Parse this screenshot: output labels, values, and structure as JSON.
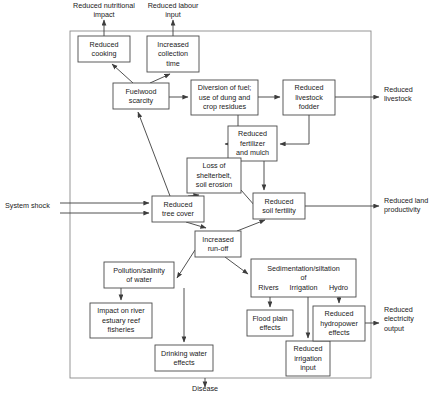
{
  "diagram": {
    "frame": {
      "x": 70,
      "y": 31,
      "width": 301,
      "height": 347
    },
    "colors": {
      "box_stroke": "#4a4a4a",
      "frame_stroke": "#8a8a8a",
      "edge_stroke": "#3d3d3d",
      "text": "#1a1a1a",
      "background": "#ffffff"
    },
    "nodes": [
      {
        "id": "reduced-cooking",
        "x": 78,
        "y": 36,
        "w": 52,
        "h": 26,
        "lines": [
          "Reduced",
          "cooking"
        ]
      },
      {
        "id": "increased-collection-time",
        "x": 147,
        "y": 36,
        "w": 52,
        "h": 36,
        "lines": [
          "Increased",
          "collection",
          "time"
        ]
      },
      {
        "id": "fuelwood-scarcity",
        "x": 113,
        "y": 83,
        "w": 56,
        "h": 26,
        "lines": [
          "Fuelwood",
          "scarcity"
        ]
      },
      {
        "id": "diversion-of-fuel",
        "x": 191,
        "y": 80,
        "w": 67,
        "h": 35,
        "lines": [
          "Diversion of fuel;",
          "use of dung and",
          "crop residues"
        ]
      },
      {
        "id": "reduced-livestock-fodder",
        "x": 283,
        "y": 80,
        "w": 52,
        "h": 35,
        "lines": [
          "Reduced",
          "livestock",
          "fodder"
        ]
      },
      {
        "id": "reduced-fertilizer-and-mulch",
        "x": 228,
        "y": 126,
        "w": 49,
        "h": 35,
        "lines": [
          "Reduced",
          "fertilizer",
          "and mulch"
        ]
      },
      {
        "id": "loss-of-shelterbelt",
        "x": 187,
        "y": 158,
        "w": 54,
        "h": 35,
        "lines": [
          "Loss of",
          "shelterbelt,",
          "soil erosion"
        ]
      },
      {
        "id": "reduced-tree-cover",
        "x": 152,
        "y": 196,
        "w": 52,
        "h": 26,
        "lines": [
          "Reduced",
          "tree cover"
        ]
      },
      {
        "id": "reduced-soil-fertility",
        "x": 253,
        "y": 193,
        "w": 52,
        "h": 26,
        "lines": [
          "Reduced",
          "soil fertility"
        ]
      },
      {
        "id": "increased-run-off",
        "x": 195,
        "y": 231,
        "w": 46,
        "h": 26,
        "lines": [
          "Increased",
          "run-off"
        ]
      },
      {
        "id": "pollution-salinity-of-water",
        "x": 104,
        "y": 262,
        "w": 70,
        "h": 26,
        "lines": [
          "Pollution/salinity",
          "of water"
        ]
      },
      {
        "id": "sedimentation-siltation",
        "x": 251,
        "y": 259,
        "w": 105,
        "h": 38,
        "lines": [
          "Sedimentation/siltation",
          "of"
        ],
        "sublabels": [
          "Rivers",
          "Irrigation",
          "Hydro"
        ]
      },
      {
        "id": "impact-on-river-estuary-reef-fisheries",
        "x": 90,
        "y": 303,
        "w": 62,
        "h": 35,
        "lines": [
          "Impact on river",
          "estuary reef",
          "fisheries"
        ]
      },
      {
        "id": "drinking-water-effects",
        "x": 155,
        "y": 345,
        "w": 58,
        "h": 26,
        "lines": [
          "Drinking water",
          "effects"
        ]
      },
      {
        "id": "flood-plain-effects",
        "x": 247,
        "y": 310,
        "w": 46,
        "h": 26,
        "lines": [
          "Flood plain",
          "effects"
        ]
      },
      {
        "id": "reduced-irrigation-input",
        "x": 286,
        "y": 341,
        "w": 44,
        "h": 35,
        "lines": [
          "Reduced",
          "irrigation",
          "input"
        ]
      },
      {
        "id": "reduced-hydropower-effects",
        "x": 313,
        "y": 306,
        "w": 52,
        "h": 35,
        "lines": [
          "Reduced",
          "hydropower",
          "effects"
        ]
      }
    ],
    "free_labels": [
      {
        "id": "reduced-nutritional-impact",
        "x": 104,
        "y": 8,
        "align": "middle",
        "lines": [
          "Reduced nutritional",
          "impact"
        ]
      },
      {
        "id": "reduced-labour-input",
        "x": 173,
        "y": 8,
        "align": "middle",
        "lines": [
          "Reduced labour",
          "input"
        ]
      },
      {
        "id": "system-shock",
        "x": 5,
        "y": 208,
        "align": "start",
        "lines": [
          "System shock"
        ]
      },
      {
        "id": "reduced-livestock",
        "x": 384,
        "y": 92,
        "align": "start",
        "lines": [
          "Reduced",
          "livestock"
        ]
      },
      {
        "id": "reduced-land-productivity",
        "x": 384,
        "y": 203,
        "align": "start",
        "lines": [
          "Reduced land",
          "productivity"
        ]
      },
      {
        "id": "reduced-electricity-output",
        "x": 384,
        "y": 312,
        "align": "start",
        "lines": [
          "Reduced",
          "electricity",
          "output"
        ]
      },
      {
        "id": "disease",
        "x": 205,
        "y": 391,
        "align": "middle",
        "lines": [
          "Disease"
        ]
      }
    ],
    "edges": [
      {
        "id": "reduced-cooking-to-nutritional",
        "from": "reduced-cooking",
        "to": "reduced-nutritional-impact",
        "points": "104,36 104,20",
        "arrow": true
      },
      {
        "id": "collection-time-to-labour-input",
        "from": "increased-collection-time",
        "to": "reduced-labour-input",
        "points": "173,36 173,20",
        "arrow": true
      },
      {
        "id": "fuelwood-to-cooking",
        "from": "fuelwood-scarcity",
        "to": "reduced-cooking",
        "points": "133,83 112,64",
        "arrow": true
      },
      {
        "id": "fuelwood-to-collection-time",
        "from": "fuelwood-scarcity",
        "to": "increased-collection-time",
        "points": "150,83 170,74",
        "arrow": true
      },
      {
        "id": "fuelwood-to-diversion",
        "from": "fuelwood-scarcity",
        "to": "diversion-of-fuel",
        "points": "169,97 188,97",
        "arrow": true
      },
      {
        "id": "diversion-to-livestock-fodder",
        "from": "diversion-of-fuel",
        "to": "reduced-livestock-fodder",
        "points": "258,97 280,97",
        "arrow": true
      },
      {
        "id": "diversion-to-fertilizer",
        "from": "diversion-of-fuel",
        "to": "reduced-fertilizer-and-mulch",
        "points": "238,115 238,144 225,144",
        "arrow": true
      },
      {
        "id": "livestock-fodder-to-fertilizer",
        "from": "reduced-livestock-fodder",
        "to": "reduced-fertilizer-and-mulch",
        "points": "309,115 309,144 280,144",
        "arrow": true
      },
      {
        "id": "livestock-fodder-to-reduced-livestock",
        "from": "reduced-livestock-fodder",
        "to": "reduced-livestock",
        "points": "335,97 379,97",
        "arrow": true
      },
      {
        "id": "fertilizer-to-soil-fertility",
        "from": "reduced-fertilizer-and-mulch",
        "to": "reduced-soil-fertility",
        "points": "264,161 264,190",
        "arrow": true
      },
      {
        "id": "tree-cover-to-fuelwood",
        "from": "reduced-tree-cover",
        "to": "fuelwood-scarcity",
        "points": "170,196 138,112",
        "arrow": true
      },
      {
        "id": "tree-cover-to-loss-shelterbelt",
        "from": "reduced-tree-cover",
        "to": "loss-of-shelterbelt",
        "points": "188,196 199,195",
        "arrow": true
      },
      {
        "id": "loss-shelterbelt-to-soil-fertility",
        "from": "loss-of-shelterbelt",
        "to": "reduced-soil-fertility",
        "points": "241,190 262,214",
        "arrow": true
      },
      {
        "id": "system-shock-to-tree-cover-1",
        "from": "system-shock",
        "to": "reduced-tree-cover",
        "points": "60,203 149,203",
        "arrow": true
      },
      {
        "id": "system-shock-to-tree-cover-2",
        "from": "system-shock",
        "to": "reduced-tree-cover",
        "points": "60,213 149,213",
        "arrow": true
      },
      {
        "id": "soil-fertility-to-land-productivity",
        "from": "reduced-soil-fertility",
        "to": "reduced-land-productivity",
        "points": "305,206 379,206",
        "arrow": true
      },
      {
        "id": "tree-cover-to-run-off",
        "from": "reduced-tree-cover",
        "to": "increased-run-off",
        "points": "186,222 206,228",
        "arrow": true
      },
      {
        "id": "run-off-to-soil-fertility",
        "from": "increased-run-off",
        "to": "reduced-soil-fertility",
        "points": "237,231 265,220",
        "arrow": true
      },
      {
        "id": "run-off-to-pollution",
        "from": "increased-run-off",
        "to": "pollution-salinity-of-water",
        "points": "195,250 177,278",
        "arrow": true
      },
      {
        "id": "run-off-to-sedimentation",
        "from": "increased-run-off",
        "to": "sedimentation-siltation",
        "points": "225,257 248,274",
        "arrow": true
      },
      {
        "id": "pollution-to-fisheries",
        "from": "pollution-salinity-of-water",
        "to": "impact-on-river-estuary-reef-fisheries",
        "points": "121,288 121,300",
        "arrow": true
      },
      {
        "id": "pollution-to-drinking-water",
        "from": "pollution-salinity-of-water",
        "to": "drinking-water-effects",
        "points": "184,288 184,342",
        "arrow": true
      },
      {
        "id": "rivers-to-flood-plain",
        "from": "sedimentation-siltation",
        "to": "flood-plain-effects",
        "points": "270,297 270,307",
        "arrow": true
      },
      {
        "id": "irrigation-to-reduced-irrigation-input",
        "from": "sedimentation-siltation",
        "to": "reduced-irrigation-input",
        "points": "308,297 308,338",
        "arrow": true
      },
      {
        "id": "hydro-to-hydropower",
        "from": "sedimentation-siltation",
        "to": "reduced-hydropower-effects",
        "points": "339,297 339,303",
        "arrow": true
      },
      {
        "id": "hydropower-to-electricity-output",
        "from": "reduced-hydropower-effects",
        "to": "reduced-electricity-output",
        "points": "365,323 379,323",
        "arrow": true
      },
      {
        "id": "frame-bottom-to-disease",
        "from": "frame",
        "to": "disease",
        "points": "205,378 205,387",
        "arrow": true
      }
    ]
  }
}
